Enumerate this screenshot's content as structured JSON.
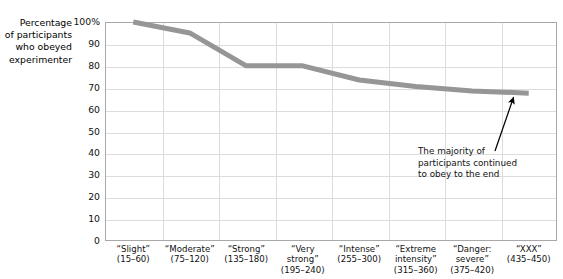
{
  "chart_data": {
    "type": "line",
    "title": "",
    "ylabel": "Percentage\nof participants\nwho obeyed\nexperimenter",
    "xlabel": "",
    "ylim": [
      0,
      100
    ],
    "yticks": [
      "100%",
      "90",
      "80",
      "70",
      "60",
      "50",
      "40",
      "30",
      "20",
      "10",
      "0"
    ],
    "ytick_values": [
      100,
      90,
      80,
      70,
      60,
      50,
      40,
      30,
      20,
      10,
      0
    ],
    "grid": true,
    "legend": "none",
    "categories": [
      "“Slight”\n(15–60)",
      "“Moderate”\n(75–120)",
      "“Strong”\n(135–180)",
      "“Very\nstrong”\n(195–240)",
      "“Intense”\n(255–300)",
      "“Extreme\nintensity”\n(315–360)",
      "“Danger:\nsevere”\n(375–420)",
      "“XXX”\n(435–450)"
    ],
    "values": [
      100,
      95,
      80,
      80,
      73.5,
      70.5,
      68.5,
      67.5
    ],
    "series": [
      {
        "name": "Percentage of participants who obeyed experimenter",
        "values": [
          100,
          95,
          80,
          80,
          73.5,
          70.5,
          68.5,
          67.5
        ],
        "color": "#969696",
        "line_width": 5
      }
    ],
    "annotations": [
      {
        "text": "The majority of\nparticipants continued\nto obey to the end",
        "arrow": true,
        "arrow_target_category": "“XXX”\n(435–450)",
        "arrow_target_value": 67.5
      }
    ],
    "colors": {
      "line": "#969696",
      "grid": "#dcdcdc",
      "axis": "#a8a8a8",
      "text": "#111111",
      "background": "#ffffff",
      "arrow": "#000000"
    }
  }
}
